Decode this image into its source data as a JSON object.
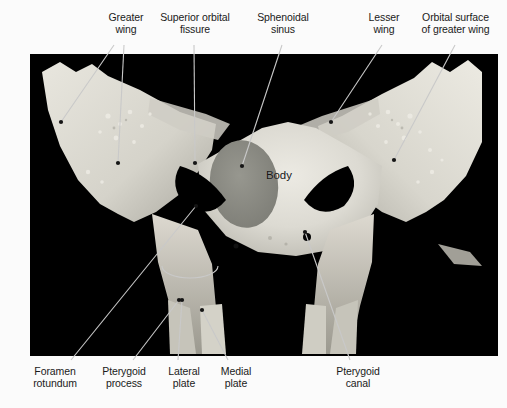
{
  "figure": {
    "background_color": "#fbfbfb",
    "photo": {
      "background_color": "#000000",
      "bone_color": "#d8d6cf",
      "sinus_color": "#8d8d85",
      "x": 30,
      "y": 54,
      "width": 468,
      "height": 302
    }
  },
  "labels": {
    "top": [
      {
        "id": "greater-wing",
        "text": "Greater\nwing",
        "x": 97,
        "y": 12
      },
      {
        "id": "superior-orbital-fissure",
        "text": "Superior orbital\nfissure",
        "x": 156,
        "y": 12
      },
      {
        "id": "sphenoidal-sinus",
        "text": "Sphenoidal\nsinus",
        "x": 251,
        "y": 12
      },
      {
        "id": "lesser-wing",
        "text": "Lesser\nwing",
        "x": 362,
        "y": 12
      },
      {
        "id": "orbital-surface-of-greater-wing",
        "text": "Orbital surface\nof greater wing",
        "x": 412,
        "y": 12
      }
    ],
    "bottom": [
      {
        "id": "foramen-rotundum",
        "text": "Foramen\nrotundum",
        "x": 25,
        "y": 368
      },
      {
        "id": "pterygoid-process",
        "text": "Pterygoid\nprocess",
        "x": 96,
        "y": 368
      },
      {
        "id": "lateral-plate",
        "text": "Lateral\nplate",
        "x": 163,
        "y": 368
      },
      {
        "id": "medial-plate",
        "text": "Medial\nplate",
        "x": 215,
        "y": 368
      },
      {
        "id": "pterygoid-canal",
        "text": "Pterygoid\ncanal",
        "x": 333,
        "y": 368
      }
    ],
    "inner": [
      {
        "id": "body",
        "text": "Body",
        "x": 268,
        "y": 172
      }
    ]
  },
  "leaders": {
    "color": "#c9c9c9",
    "dot_color": "#151515",
    "lines": [
      {
        "id": "greater-wing-a",
        "x1": 114,
        "y1": 45,
        "x2": 61,
        "y2": 122
      },
      {
        "id": "greater-wing-b",
        "x1": 124,
        "y1": 45,
        "x2": 118,
        "y2": 163
      },
      {
        "id": "superior-orbital-fissure",
        "x1": 194,
        "y1": 45,
        "x2": 195,
        "y2": 163
      },
      {
        "id": "sphenoidal-sinus",
        "x1": 282,
        "y1": 45,
        "x2": 242,
        "y2": 166
      },
      {
        "id": "lesser-wing",
        "x1": 382,
        "y1": 45,
        "x2": 331,
        "y2": 122
      },
      {
        "id": "orbital-surface",
        "x1": 455,
        "y1": 45,
        "x2": 394,
        "y2": 160
      },
      {
        "id": "foramen-rotundum",
        "x1": 71,
        "y1": 360,
        "x2": 196,
        "y2": 206
      },
      {
        "id": "pterygoid-process",
        "x1": 133,
        "y1": 360,
        "x2": 179,
        "y2": 300
      },
      {
        "id": "lateral-plate",
        "x1": 178,
        "y1": 360,
        "x2": 182,
        "y2": 300
      },
      {
        "id": "medial-plate",
        "x1": 228,
        "y1": 360,
        "x2": 202,
        "y2": 310
      },
      {
        "id": "pterygoid-canal",
        "x1": 350,
        "y1": 360,
        "x2": 305,
        "y2": 232
      }
    ],
    "bracket": {
      "id": "pterygoid-process-bracket",
      "cx": 190,
      "cy": 278,
      "rx": 28,
      "ry": 12
    }
  }
}
